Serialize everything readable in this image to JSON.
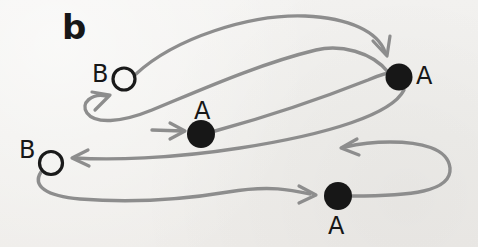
{
  "figure": {
    "panel_label": "b",
    "background_color": "#f2f1ee",
    "stroke_color": "#8d8d8d",
    "ink_color": "#1a1a1a",
    "width": 478,
    "height": 247
  },
  "nodes": [
    {
      "id": "node-b-upper",
      "label": "B",
      "type": "open-circle",
      "label_text": "B",
      "cx": 124,
      "cy": 79,
      "r": 11,
      "label_x": 92,
      "label_y": 62,
      "label_size": 24
    },
    {
      "id": "node-a-right",
      "label": "A",
      "type": "filled-circle",
      "label_text": "A",
      "cx": 399,
      "cy": 77,
      "r": 13,
      "label_x": 416,
      "label_y": 64,
      "label_size": 24
    },
    {
      "id": "node-a-middle",
      "label": "A",
      "type": "filled-circle",
      "label_text": "A",
      "cx": 201,
      "cy": 134,
      "r": 14,
      "label_x": 194,
      "label_y": 99,
      "label_size": 24
    },
    {
      "id": "node-b-lower",
      "label": "B",
      "type": "open-circle",
      "label_text": "B",
      "cx": 51,
      "cy": 163,
      "r": 11,
      "label_x": 19,
      "label_y": 138,
      "label_size": 24
    },
    {
      "id": "node-a-bottom",
      "label": "A",
      "type": "filled-circle",
      "label_text": "A",
      "cx": 338,
      "cy": 196,
      "r": 14,
      "label_x": 328,
      "label_y": 214,
      "label_size": 24
    }
  ],
  "edges": [
    {
      "id": "edge-b-upper-to-a-right",
      "from": "node-b-upper",
      "to": "node-a-right",
      "arrow": "down-right",
      "path": "M 136 74 C 175 38 250 14 305 16 C 350 18 378 32 385 52"
    },
    {
      "id": "edge-a-right-loop-to-b-upper",
      "from": "node-a-right",
      "to": "node-b-upper",
      "arrow": "up-right",
      "path": "M 388 72 C 372 52 340 44 316 50 C 258 64 196 92 152 110 C 120 123 95 124 87 113 C 80 103 92 93 106 96"
    },
    {
      "id": "edge-short-into-a-middle",
      "from": "node-b-upper",
      "to": "node-a-middle",
      "arrow": "right",
      "path": "M 152 130 L 183 131"
    },
    {
      "id": "edge-a-middle-to-a-right",
      "from": "node-a-middle",
      "to": "node-a-right",
      "arrow": "none",
      "path": "M 215 131 C 270 116 330 95 368 80 C 382 74 390 72 396 72"
    },
    {
      "id": "edge-a-right-to-b-lower",
      "from": "node-a-right",
      "to": "node-b-lower",
      "arrow": "left",
      "path": "M 404 90 C 392 114 330 134 240 148 C 170 159 110 160 75 158"
    },
    {
      "id": "edge-a-bottom-uturn-to-left",
      "from": "node-a-bottom",
      "to": "node-b-lower",
      "arrow": "left",
      "path": "M 352 196 C 410 196 452 192 450 168 C 448 148 420 142 390 142 C 375 142 358 144 345 147"
    },
    {
      "id": "edge-b-lower-to-a-bottom",
      "from": "node-b-lower",
      "to": "node-a-bottom",
      "arrow": "right",
      "path": "M 41 172 C 32 186 46 196 80 199 C 130 203 180 200 228 192 C 270 185 292 190 310 194"
    }
  ]
}
